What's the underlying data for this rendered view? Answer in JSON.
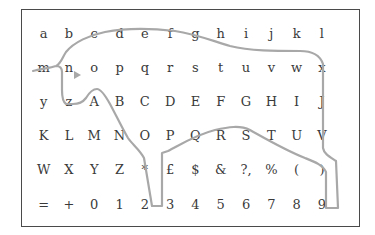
{
  "grid": {
    "rows": [
      [
        "a",
        "b",
        "c",
        "d",
        "e",
        "f",
        "g",
        "h",
        "i",
        "j",
        "k",
        "l"
      ],
      [
        "m",
        "n",
        "o",
        "p",
        "q",
        "r",
        "s",
        "t",
        "u",
        "v",
        "w",
        "x"
      ],
      [
        "y",
        "z",
        "A",
        "B",
        "C",
        "D",
        "E",
        "F",
        "G",
        "H",
        "I",
        "J"
      ],
      [
        "K",
        "L",
        "M",
        "N",
        "O",
        "P",
        "Q",
        "R",
        "S",
        "T",
        "U",
        "V"
      ],
      [
        "W",
        "X",
        "Y",
        "Z",
        "*",
        "£",
        "$",
        "&",
        "?,",
        "%",
        "(",
        ")"
      ],
      [
        "=",
        "+",
        "0",
        "1",
        "2",
        "3",
        "4",
        "5",
        "6",
        "7",
        "8",
        "9"
      ]
    ]
  },
  "overlay": {
    "shape": "bull-outline",
    "stroke_color": "#a8a8a8",
    "marker": "triangle-eye"
  },
  "colors": {
    "text": "#3a3a3a",
    "border": "#4a4a4a",
    "outline": "#a8a8a8"
  }
}
